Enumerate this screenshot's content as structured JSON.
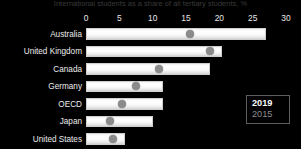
{
  "chart_data": {
    "type": "bar",
    "title": "International students as a share of all tertiary students, %",
    "xlabel": "",
    "ylabel": "",
    "xlim": [
      0,
      30
    ],
    "xticks": [
      0,
      5,
      10,
      15,
      20,
      25,
      30
    ],
    "grid": false,
    "orientation": "horizontal",
    "legend_position": "right-inside",
    "categories": [
      "Australia",
      "United Kingdom",
      "Canada",
      "Germany",
      "OECD",
      "Japan",
      "United States"
    ],
    "series": [
      {
        "name": "2019",
        "render": "bar",
        "color": "#ffffff",
        "values": [
          27.0,
          20.4,
          18.6,
          11.6,
          11.6,
          10.0,
          5.8
        ]
      },
      {
        "name": "2015",
        "render": "marker",
        "color": "#8a8a8a",
        "values": [
          15.6,
          18.6,
          11.0,
          7.5,
          5.4,
          3.6,
          4.1
        ]
      }
    ]
  },
  "legend": {
    "entries": [
      {
        "label": "2019"
      },
      {
        "label": "2015"
      }
    ]
  },
  "colors": {
    "background": "#000000",
    "bar_2019": "#ffffff",
    "marker_2015": "#8a8a8a",
    "text": "#eaeaea",
    "legend_border": "#5e5e5e"
  }
}
